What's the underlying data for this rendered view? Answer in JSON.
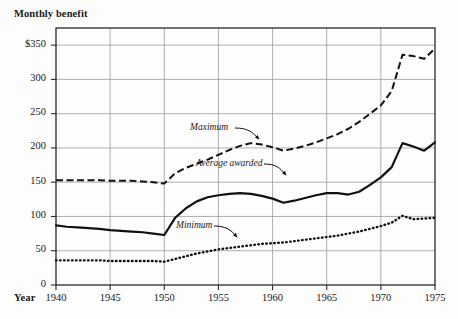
{
  "axis_titles": {
    "y": "Monthly benefit",
    "x": "Year"
  },
  "annotations": {
    "maximum": "Maximum",
    "average": "Average awarded",
    "minimum": "Minimum"
  },
  "y_ticks": [
    {
      "label": "$350",
      "value": 350
    },
    {
      "label": "300",
      "value": 300
    },
    {
      "label": "250",
      "value": 250
    },
    {
      "label": "200",
      "value": 200
    },
    {
      "label": "150",
      "value": 150
    },
    {
      "label": "100",
      "value": 100
    },
    {
      "label": "50",
      "value": 50
    },
    {
      "label": "0",
      "value": 0
    }
  ],
  "x_ticks": [
    {
      "label": "1940",
      "value": 1940
    },
    {
      "label": "1945",
      "value": 1945
    },
    {
      "label": "1950",
      "value": 1950
    },
    {
      "label": "1955",
      "value": 1955
    },
    {
      "label": "1960",
      "value": 1960
    },
    {
      "label": "1965",
      "value": 1965
    },
    {
      "label": "1970",
      "value": 1970
    },
    {
      "label": "1975",
      "value": 1975
    }
  ],
  "chart_data": {
    "type": "line",
    "title": "",
    "xlabel": "Year",
    "ylabel": "Monthly benefit",
    "xlim": [
      1940,
      1975
    ],
    "ylim": [
      0,
      375
    ],
    "grid": true,
    "legend_position": "inline-annotations",
    "x": [
      1940,
      1941,
      1942,
      1943,
      1944,
      1945,
      1946,
      1947,
      1948,
      1949,
      1950,
      1951,
      1952,
      1953,
      1954,
      1955,
      1956,
      1957,
      1958,
      1959,
      1960,
      1961,
      1962,
      1963,
      1964,
      1965,
      1966,
      1967,
      1968,
      1969,
      1970,
      1971,
      1972,
      1973,
      1974,
      1975
    ],
    "series": [
      {
        "name": "Maximum",
        "style": "dashed",
        "values": [
          153,
          153,
          153,
          153,
          153,
          152,
          152,
          152,
          151,
          150,
          148,
          163,
          171,
          177,
          183,
          190,
          197,
          203,
          207,
          205,
          201,
          196,
          199,
          203,
          208,
          214,
          220,
          228,
          238,
          250,
          262,
          283,
          336,
          334,
          330,
          345
        ]
      },
      {
        "name": "Average awarded",
        "style": "solid",
        "values": [
          87,
          85,
          84,
          83,
          82,
          80,
          79,
          78,
          77,
          75,
          73,
          98,
          112,
          122,
          128,
          131,
          133,
          134,
          133,
          130,
          126,
          120,
          123,
          127,
          131,
          134,
          134,
          132,
          136,
          146,
          157,
          172,
          207,
          202,
          196,
          208
        ]
      },
      {
        "name": "Minimum",
        "style": "dotted",
        "values": [
          36,
          36,
          36,
          36,
          36,
          35,
          35,
          35,
          35,
          35,
          34,
          38,
          42,
          46,
          49,
          52,
          54,
          56,
          58,
          60,
          61,
          62,
          64,
          66,
          68,
          70,
          72,
          75,
          78,
          82,
          86,
          91,
          101,
          96,
          97,
          98
        ]
      }
    ]
  },
  "colors": {
    "ink": "#1a1a1a",
    "grid": "#9a9a9a",
    "frame": "#2a2a2a",
    "background": "#fdfdfd"
  }
}
